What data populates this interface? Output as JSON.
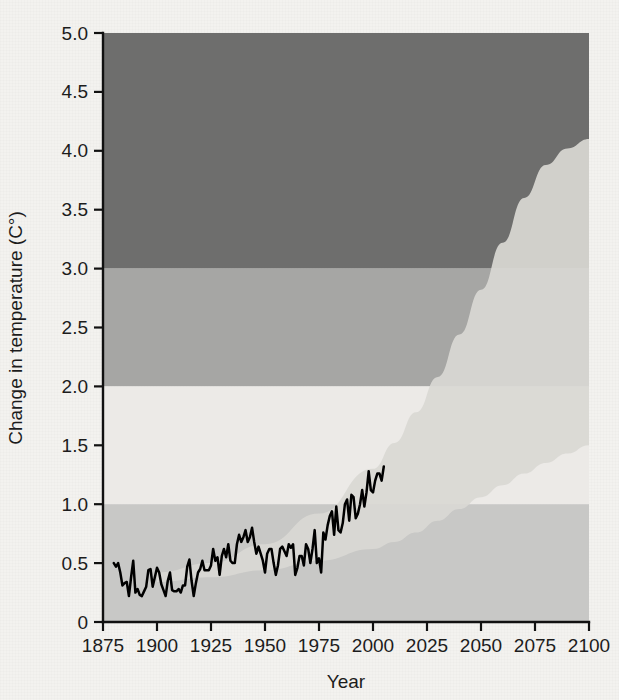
{
  "chart_data": {
    "type": "line",
    "title": "",
    "xlabel": "Year",
    "ylabel": "Change in temperature (C°)",
    "xlim": [
      1875,
      2100
    ],
    "ylim": [
      0,
      5.0
    ],
    "grid": false,
    "legend": "none",
    "x_ticks": [
      "1875",
      "1900",
      "1925",
      "1950",
      "1975",
      "2000",
      "2025",
      "2050",
      "2075",
      "2100"
    ],
    "x_tick_values": [
      1875,
      1900,
      1925,
      1950,
      1975,
      2000,
      2025,
      2050,
      2075,
      2100
    ],
    "y_ticks": [
      "0",
      "0.5",
      "1.0",
      "1.5",
      "2.0",
      "2.5",
      "3.0",
      "3.5",
      "4.0",
      "4.5",
      "5.0"
    ],
    "y_tick_values": [
      0,
      0.5,
      1.0,
      1.5,
      2.0,
      2.5,
      3.0,
      3.5,
      4.0,
      4.5,
      5.0
    ],
    "bands": [
      {
        "name": "low-risk-band",
        "from": 0.0,
        "to": 1.0,
        "color": "#c8c8c6"
      },
      {
        "name": "moderate-risk-band",
        "from": 1.0,
        "to": 2.0,
        "color": "#eceae7"
      },
      {
        "name": "high-risk-band",
        "from": 2.0,
        "to": 3.0,
        "color": "#a6a6a4"
      },
      {
        "name": "severe-risk-band",
        "from": 3.0,
        "to": 5.0,
        "color": "#6e6e6d"
      }
    ],
    "projection_cone": {
      "name": "projection-range",
      "color": "#d9d8d4",
      "upper": [
        [
          1900,
          0.42
        ],
        [
          1925,
          0.5
        ],
        [
          1950,
          0.66
        ],
        [
          1975,
          0.92
        ],
        [
          2000,
          1.3
        ],
        [
          2010,
          1.52
        ],
        [
          2020,
          1.78
        ],
        [
          2030,
          2.08
        ],
        [
          2040,
          2.44
        ],
        [
          2050,
          2.82
        ],
        [
          2060,
          3.22
        ],
        [
          2070,
          3.6
        ],
        [
          2080,
          3.88
        ],
        [
          2090,
          4.02
        ],
        [
          2100,
          4.1
        ]
      ],
      "lower": [
        [
          1900,
          0.34
        ],
        [
          1925,
          0.38
        ],
        [
          1950,
          0.44
        ],
        [
          1975,
          0.52
        ],
        [
          2000,
          0.62
        ],
        [
          2010,
          0.68
        ],
        [
          2020,
          0.76
        ],
        [
          2030,
          0.86
        ],
        [
          2040,
          0.96
        ],
        [
          2050,
          1.06
        ],
        [
          2060,
          1.16
        ],
        [
          2070,
          1.26
        ],
        [
          2080,
          1.35
        ],
        [
          2090,
          1.43
        ],
        [
          2100,
          1.5
        ]
      ]
    },
    "series": [
      {
        "name": "observed-temperature",
        "color": "#000000",
        "x": [
          1880,
          1881,
          1882,
          1883,
          1884,
          1885,
          1886,
          1887,
          1888,
          1889,
          1890,
          1891,
          1892,
          1893,
          1894,
          1895,
          1896,
          1897,
          1898,
          1899,
          1900,
          1901,
          1902,
          1903,
          1904,
          1905,
          1906,
          1907,
          1908,
          1909,
          1910,
          1911,
          1912,
          1913,
          1914,
          1915,
          1916,
          1917,
          1918,
          1919,
          1920,
          1921,
          1922,
          1923,
          1924,
          1925,
          1926,
          1927,
          1928,
          1929,
          1930,
          1931,
          1932,
          1933,
          1934,
          1935,
          1936,
          1937,
          1938,
          1939,
          1940,
          1941,
          1942,
          1943,
          1944,
          1945,
          1946,
          1947,
          1948,
          1949,
          1950,
          1951,
          1952,
          1953,
          1954,
          1955,
          1956,
          1957,
          1958,
          1959,
          1960,
          1961,
          1962,
          1963,
          1964,
          1965,
          1966,
          1967,
          1968,
          1969,
          1970,
          1971,
          1972,
          1973,
          1974,
          1975,
          1976,
          1977,
          1978,
          1979,
          1980,
          1981,
          1982,
          1983,
          1984,
          1985,
          1986,
          1987,
          1988,
          1989,
          1990,
          1991,
          1992,
          1993,
          1994,
          1995,
          1996,
          1997,
          1998,
          1999,
          2000,
          2001,
          2002,
          2003,
          2004,
          2005
        ],
        "y": [
          0.5,
          0.47,
          0.5,
          0.42,
          0.31,
          0.33,
          0.34,
          0.22,
          0.38,
          0.52,
          0.25,
          0.28,
          0.23,
          0.22,
          0.26,
          0.3,
          0.44,
          0.45,
          0.3,
          0.38,
          0.46,
          0.42,
          0.32,
          0.27,
          0.22,
          0.35,
          0.42,
          0.27,
          0.26,
          0.26,
          0.28,
          0.25,
          0.31,
          0.31,
          0.47,
          0.53,
          0.35,
          0.22,
          0.33,
          0.42,
          0.45,
          0.52,
          0.44,
          0.44,
          0.44,
          0.48,
          0.62,
          0.52,
          0.55,
          0.4,
          0.56,
          0.62,
          0.55,
          0.66,
          0.52,
          0.5,
          0.5,
          0.66,
          0.74,
          0.68,
          0.72,
          0.78,
          0.68,
          0.72,
          0.8,
          0.68,
          0.58,
          0.64,
          0.58,
          0.52,
          0.42,
          0.58,
          0.62,
          0.62,
          0.5,
          0.4,
          0.48,
          0.62,
          0.64,
          0.6,
          0.56,
          0.66,
          0.63,
          0.66,
          0.4,
          0.46,
          0.56,
          0.56,
          0.48,
          0.66,
          0.62,
          0.5,
          0.62,
          0.78,
          0.5,
          0.54,
          0.42,
          0.76,
          0.7,
          0.82,
          0.9,
          0.94,
          0.74,
          0.98,
          0.78,
          0.76,
          0.84,
          1.0,
          1.04,
          0.86,
          1.08,
          1.06,
          0.88,
          0.92,
          1.0,
          1.12,
          0.98,
          1.1,
          1.28,
          1.12,
          1.1,
          1.2,
          1.26,
          1.26,
          1.2,
          1.32
        ]
      }
    ]
  },
  "axes": {
    "y_title": "Change in temperature (C°)",
    "x_title": "Year"
  }
}
